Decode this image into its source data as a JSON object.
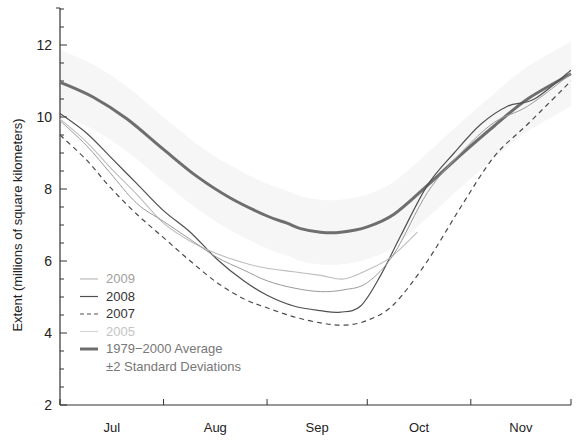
{
  "chart_data": {
    "type": "line",
    "title": "",
    "xlabel": "",
    "ylabel": "Extent (millions of square kilometers)",
    "ylim": [
      2,
      13
    ],
    "yticks": [
      2,
      4,
      6,
      8,
      10,
      12
    ],
    "x_months": [
      "Jul",
      "Aug",
      "Sep",
      "Oct",
      "Nov"
    ],
    "x_domain_days": [
      0,
      153
    ],
    "grid": false,
    "legend_position": "lower left",
    "legend": [
      {
        "name": "2009",
        "style": "solid",
        "color": "#b9b9b9"
      },
      {
        "name": "2008",
        "style": "solid",
        "color": "#555555"
      },
      {
        "name": "2007",
        "style": "dashed",
        "color": "#555555"
      },
      {
        "name": "2005",
        "style": "solid",
        "color": "#d2d2d2"
      },
      {
        "name": "1979−2000 Average",
        "style": "thick",
        "color": "#6a6a6a"
      },
      {
        "name": "±2 Standard Deviations",
        "style": "band",
        "color": "#f2f2f2"
      }
    ],
    "series": [
      {
        "name": "1979−2000 Average",
        "x_days": [
          0,
          10,
          20,
          31,
          41,
          51,
          62,
          68,
          72,
          78,
          84,
          92,
          100,
          110,
          120,
          130,
          140,
          153
        ],
        "values": [
          10.97,
          10.55,
          9.95,
          9.1,
          8.35,
          7.75,
          7.25,
          7.05,
          6.9,
          6.8,
          6.8,
          6.95,
          7.3,
          8.1,
          8.95,
          9.75,
          10.5,
          11.2
        ]
      },
      {
        "name": "2008",
        "x_days": [
          0,
          8,
          15,
          23,
          31,
          39,
          47,
          55,
          62,
          70,
          78,
          84,
          90,
          96,
          102,
          110,
          118,
          126,
          134,
          142,
          153
        ],
        "values": [
          10.1,
          9.55,
          8.9,
          8.15,
          7.4,
          6.8,
          6.05,
          5.45,
          5.05,
          4.75,
          4.62,
          4.58,
          4.75,
          5.6,
          6.7,
          8.1,
          9.0,
          9.8,
          10.3,
          10.5,
          11.3
        ]
      },
      {
        "name": "2009",
        "x_days": [
          0,
          8,
          15,
          23,
          31,
          39,
          47,
          55,
          62,
          70,
          78,
          85,
          92,
          99,
          107
        ],
        "values": [
          9.95,
          9.3,
          8.6,
          7.85,
          7.05,
          6.55,
          6.2,
          5.95,
          5.8,
          5.7,
          5.6,
          5.5,
          5.75,
          6.1,
          6.8
        ]
      },
      {
        "name": "2005",
        "x_days": [
          0,
          8,
          15,
          23,
          31,
          39,
          47,
          55,
          62,
          70,
          78,
          85,
          92,
          100,
          110,
          120,
          130,
          140,
          153
        ],
        "values": [
          9.9,
          9.2,
          8.45,
          7.6,
          7.1,
          6.6,
          6.1,
          5.75,
          5.45,
          5.25,
          5.15,
          5.2,
          5.4,
          6.2,
          7.9,
          9.0,
          9.85,
          10.3,
          11.2
        ]
      },
      {
        "name": "2007",
        "x_days": [
          0,
          8,
          15,
          23,
          31,
          39,
          47,
          55,
          62,
          70,
          78,
          85,
          92,
          100,
          110,
          120,
          130,
          140,
          153
        ],
        "values": [
          9.5,
          8.8,
          8.05,
          7.3,
          6.65,
          6.0,
          5.4,
          4.95,
          4.7,
          4.45,
          4.28,
          4.22,
          4.35,
          4.8,
          6.0,
          7.5,
          8.9,
          9.8,
          11.0
        ]
      }
    ]
  }
}
